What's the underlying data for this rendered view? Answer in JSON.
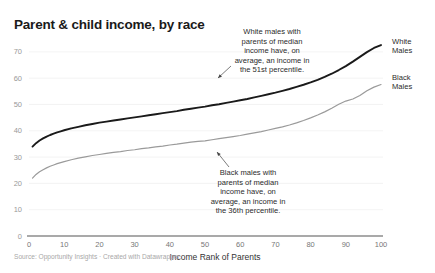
{
  "header": {
    "title": "Parent & child income, by race"
  },
  "footer": {
    "source": "Source: Opportunity Insights · Created with Datawrapper"
  },
  "annotations": {
    "white": {
      "lines": [
        "White males with",
        "parents of median",
        "income have, on",
        "average, an income in",
        "the 51st percentile."
      ]
    },
    "black": {
      "lines": [
        "Black males with",
        "parents of median",
        "income have, on",
        "average, an income in",
        "the 36th percentile."
      ]
    }
  },
  "series_labels": {
    "white_line1": "White",
    "white_line2": "Males",
    "black_line1": "Black",
    "black_line2": "Males"
  },
  "colors": {
    "white_males": "#1a1a1a",
    "black_males": "#9a9a9a",
    "grid": "#f0f0f0",
    "axis": "#555555",
    "title": "#1a1a1a",
    "source": "#a8a8a8"
  },
  "chart_data": {
    "type": "line",
    "title": "Parent & child income, by race",
    "xlabel": "Income Rank of Parents",
    "ylabel": "",
    "xlim": [
      0,
      100
    ],
    "ylim": [
      0,
      73
    ],
    "grid": true,
    "legend_position": "right-inline",
    "xticks": [
      0,
      10,
      20,
      30,
      40,
      50,
      60,
      70,
      80,
      90,
      100
    ],
    "yticks": [
      0,
      10,
      20,
      30,
      40,
      50,
      60,
      70
    ],
    "x": [
      1,
      2,
      3,
      4,
      5,
      6,
      7,
      8,
      9,
      10,
      12,
      14,
      16,
      18,
      20,
      22,
      24,
      26,
      28,
      30,
      32,
      34,
      36,
      38,
      40,
      42,
      44,
      46,
      48,
      50,
      52,
      54,
      56,
      58,
      60,
      62,
      64,
      66,
      68,
      70,
      72,
      74,
      76,
      78,
      80,
      82,
      84,
      86,
      88,
      90,
      92,
      94,
      96,
      98,
      100
    ],
    "series": [
      {
        "name": "White Males",
        "color": "#1a1a1a",
        "values": [
          34.0,
          35.3,
          36.3,
          37.1,
          37.8,
          38.4,
          38.9,
          39.4,
          39.8,
          40.2,
          40.9,
          41.5,
          42.1,
          42.6,
          43.1,
          43.5,
          43.9,
          44.3,
          44.7,
          45.1,
          45.5,
          45.9,
          46.3,
          46.7,
          47.1,
          47.5,
          48.0,
          48.4,
          48.8,
          49.2,
          49.7,
          50.1,
          50.6,
          51.1,
          51.6,
          52.1,
          52.7,
          53.3,
          53.9,
          54.5,
          55.2,
          55.9,
          56.7,
          57.5,
          58.4,
          59.4,
          60.5,
          61.7,
          63.1,
          64.6,
          66.3,
          68.1,
          69.9,
          71.5,
          72.6
        ],
        "annotation_point": {
          "x": 50,
          "y": 51
        }
      },
      {
        "name": "Black Males",
        "color": "#9a9a9a",
        "values": [
          22.0,
          23.4,
          24.4,
          25.2,
          25.9,
          26.5,
          27.0,
          27.5,
          27.9,
          28.3,
          29.0,
          29.6,
          30.1,
          30.6,
          31.0,
          31.4,
          31.8,
          32.1,
          32.5,
          32.8,
          33.2,
          33.5,
          33.9,
          34.2,
          34.6,
          34.9,
          35.3,
          35.7,
          36.0,
          36.2,
          36.6,
          37.0,
          37.4,
          37.8,
          38.2,
          38.7,
          39.2,
          39.7,
          40.3,
          40.9,
          41.5,
          42.2,
          43.0,
          43.9,
          44.9,
          46.0,
          47.2,
          48.6,
          50.1,
          51.3,
          52.1,
          53.4,
          55.2,
          56.6,
          57.6
        ],
        "annotation_point": {
          "x": 50,
          "y": 36
        }
      }
    ]
  }
}
